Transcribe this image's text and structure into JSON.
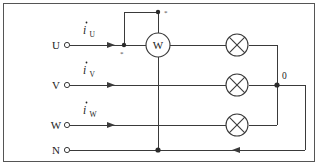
{
  "diagram": {
    "terminals": [
      {
        "id": "u",
        "label": "U",
        "current_symbol": "i",
        "current_subscript": "U"
      },
      {
        "id": "v",
        "label": "V",
        "current_symbol": "i",
        "current_subscript": "V"
      },
      {
        "id": "w",
        "label": "W",
        "current_symbol": "i",
        "current_subscript": "W"
      },
      {
        "id": "n",
        "label": "N",
        "current_symbol": "",
        "current_subscript": ""
      }
    ],
    "meter": {
      "label": "W",
      "name": "wattmeter",
      "polarity_mark_current": "*",
      "polarity_mark_voltage": "*"
    },
    "loads": [
      {
        "id": "lamp-u",
        "symbol": "crossed-circle",
        "phase": "U"
      },
      {
        "id": "lamp-v",
        "symbol": "crossed-circle",
        "phase": "V"
      },
      {
        "id": "lamp-w",
        "symbol": "crossed-circle",
        "phase": "W"
      }
    ],
    "nodes": [
      {
        "id": "star-point",
        "label": "0"
      }
    ],
    "colors": {
      "wire": "#3a3a3a",
      "frame": "#555555",
      "text": "#222222",
      "background": "#ffffff"
    }
  }
}
